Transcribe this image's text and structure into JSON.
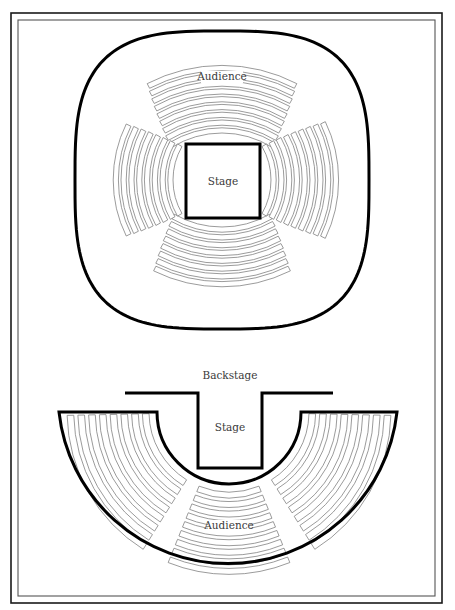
{
  "page": {
    "width": 455,
    "height": 610,
    "colors": {
      "background": "#ffffff",
      "wall": "#000000",
      "seat_outline": "#7a7a7a",
      "frame": "#1a1a1a",
      "label": "#3a3a3a"
    }
  },
  "frame": {
    "outer": {
      "x": 11,
      "y": 13,
      "w": 431,
      "h": 590
    },
    "inner": {
      "x": 18,
      "y": 20,
      "w": 417,
      "h": 576
    }
  },
  "arena_stage": {
    "name": "Theatre in the round",
    "outline": {
      "cx": 222,
      "cy": 180,
      "rx": 147,
      "ry": 149,
      "exponent": 3.2
    },
    "stage": {
      "x": 186,
      "y": 144,
      "w": 74,
      "h": 74,
      "label": "Stage"
    },
    "audience_label": "Audience",
    "sections": [
      {
        "id": "top",
        "center_deg": -90,
        "half_span_deg": 32,
        "inner_r": 95,
        "rows": 9,
        "row_depth": 5.2,
        "row_gap": 2.6
      },
      {
        "id": "bottom",
        "center_deg": 90,
        "half_span_deg": 30,
        "inner_r": 95,
        "rows": 8,
        "row_depth": 5.2,
        "row_gap": 2.6
      },
      {
        "id": "left",
        "center_deg": 180,
        "half_span_deg": 30,
        "inner_r": 67,
        "rows": 8,
        "row_depth": 5.2,
        "row_gap": 2.6
      },
      {
        "id": "right",
        "center_deg": 0,
        "half_span_deg": 30,
        "inner_r": 67,
        "rows": 9,
        "row_depth": 5.2,
        "row_gap": 2.6
      }
    ]
  },
  "thrust_stage": {
    "name": "Thrust stage",
    "backstage_label": "Backstage",
    "stage_label": "Stage",
    "audience_label": "Audience",
    "backstage_wall": {
      "y": 393,
      "x1": 125,
      "x2": 333
    },
    "stage_notch": {
      "x1": 198,
      "x2": 262,
      "bottom": 468
    },
    "seating": {
      "cx": 229,
      "cy": 412,
      "outer_r": 170,
      "inner_r": 72,
      "top_y": 412,
      "left_x": 59,
      "right_x": 397
    },
    "sections": [
      {
        "id": "left",
        "start_deg": 180,
        "end_deg": 122,
        "rows": 8
      },
      {
        "id": "center",
        "start_deg": 112,
        "end_deg": 68,
        "rows": 9
      },
      {
        "id": "right",
        "start_deg": 58,
        "end_deg": 0,
        "rows": 8
      }
    ]
  }
}
